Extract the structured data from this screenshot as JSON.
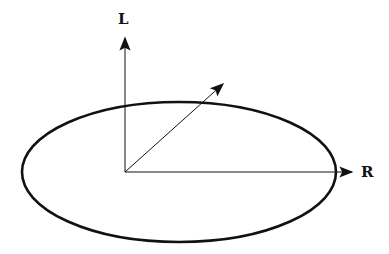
{
  "diagram": {
    "labels": {
      "vertical_axis": "L",
      "horizontal_axis": "R"
    },
    "elements": [
      {
        "type": "ellipse",
        "description": "large ellipse centered around origin region"
      },
      {
        "type": "arrow",
        "name": "vertical-axis",
        "label": "L"
      },
      {
        "type": "arrow",
        "name": "horizontal-axis",
        "label": "R"
      },
      {
        "type": "arrow",
        "name": "diagonal-vector",
        "label": ""
      }
    ],
    "colors": {
      "stroke": "#111111",
      "background": "#ffffff"
    }
  }
}
